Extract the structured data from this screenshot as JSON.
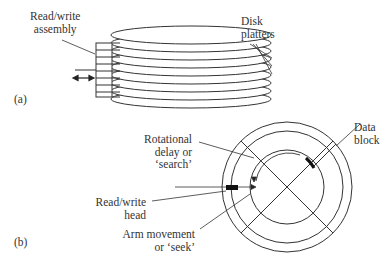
{
  "figure": {
    "panel_a": {
      "tag": "(a)",
      "labels": {
        "read_write_assembly": [
          "Read/write",
          "assembly"
        ],
        "disk_platters": [
          "Disk",
          "platters"
        ]
      },
      "platter_count": 8
    },
    "panel_b": {
      "tag": "(b)",
      "labels": {
        "rotational_delay": [
          "Rotational",
          "delay or",
          "‘search’"
        ],
        "read_write_head": [
          "Read/write",
          "head"
        ],
        "arm_movement": [
          "Arm movement",
          "or ‘seek’"
        ],
        "data_block": [
          "Data",
          "block"
        ]
      }
    }
  }
}
